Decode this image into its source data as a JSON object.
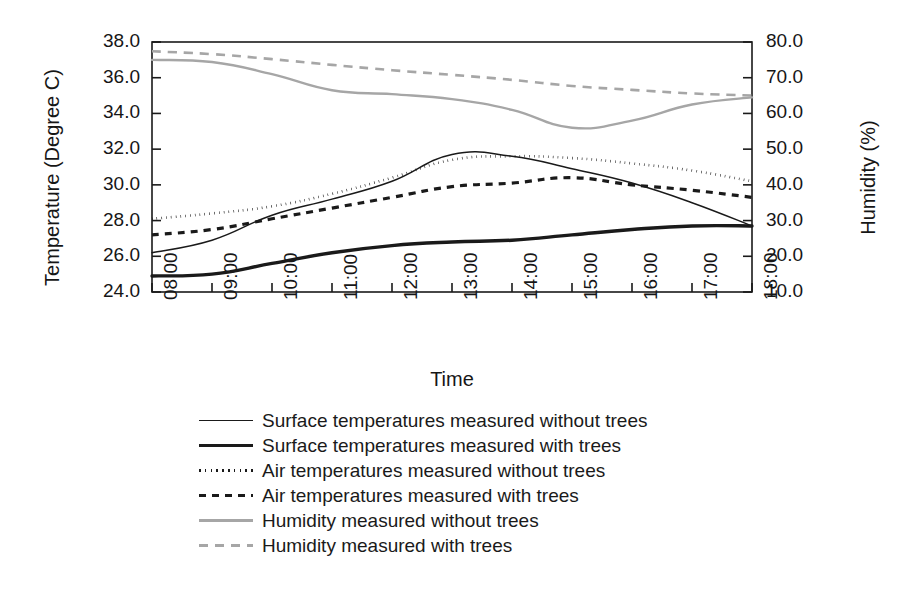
{
  "chart_data": {
    "type": "line",
    "title": "",
    "xlabel": "Time",
    "ylabel": "Temperature (Degree C)",
    "y2label": "Humidity (%)",
    "categories": [
      "08:00",
      "09:00",
      "10:00",
      "11:00",
      "12:00",
      "13:00",
      "14:00",
      "15:00",
      "16:00",
      "17:00",
      "18:00"
    ],
    "x_tick_labels": [
      "08:00",
      "09:00",
      "10:00",
      "11:00",
      "12:00",
      "13:00",
      "14:00",
      "15:00",
      "16:00",
      "17:00",
      "18:00"
    ],
    "y_tick_labels": [
      "38.0",
      "36.0",
      "34.0",
      "32.0",
      "30.0",
      "28.0",
      "26.0",
      "24.0"
    ],
    "y2_tick_labels": [
      "80.0",
      "70.0",
      "60.0",
      "50.0",
      "40.0",
      "30.0",
      "20.0",
      "10.0"
    ],
    "ylim": [
      24.0,
      38.0
    ],
    "y2lim": [
      10.0,
      80.0
    ],
    "grid": false,
    "legend_position": "below",
    "series": [
      {
        "name": "Surface temperatures measured without trees",
        "axis": "left",
        "style": "solid-thin",
        "color": "#1a1a1a",
        "values": [
          26.2,
          26.9,
          28.3,
          29.2,
          30.2,
          31.7,
          31.6,
          30.9,
          30.1,
          29.0,
          27.7
        ]
      },
      {
        "name": "Surface temperatures measured with trees",
        "axis": "left",
        "style": "solid-thick",
        "color": "#1a1a1a",
        "values": [
          24.9,
          25.0,
          25.6,
          26.2,
          26.6,
          26.8,
          26.9,
          27.2,
          27.5,
          27.7,
          27.7
        ]
      },
      {
        "name": "Air temperatures measured without trees",
        "axis": "left",
        "style": "dotted",
        "color": "#1a1a1a",
        "values": [
          28.1,
          28.4,
          28.8,
          29.5,
          30.4,
          31.4,
          31.6,
          31.5,
          31.2,
          30.8,
          30.2
        ]
      },
      {
        "name": "Air temperatures measured with trees",
        "axis": "left",
        "style": "dashed",
        "color": "#1a1a1a",
        "values": [
          27.2,
          27.5,
          28.1,
          28.7,
          29.3,
          29.9,
          30.1,
          30.4,
          30.0,
          29.7,
          29.3
        ]
      },
      {
        "name": "Humidity measured without trees",
        "axis": "right",
        "style": "solid-grey",
        "color": "#a6a6a6",
        "values": [
          75.0,
          74.4,
          71.0,
          66.5,
          65.4,
          64.0,
          61.0,
          56.0,
          58.0,
          62.5,
          64.5
        ]
      },
      {
        "name": "Humidity measured with trees",
        "axis": "right",
        "style": "dashed-grey",
        "color": "#a6a6a6",
        "values": [
          77.4,
          76.6,
          75.2,
          73.6,
          72.1,
          70.8,
          69.4,
          67.7,
          66.6,
          65.6,
          65.0
        ]
      }
    ]
  },
  "legend": {
    "entries": [
      {
        "label": "Surface temperatures measured without trees"
      },
      {
        "label": "Surface temperatures measured with trees"
      },
      {
        "label": "Air temperatures measured without trees"
      },
      {
        "label": "Air temperatures measured with trees"
      },
      {
        "label": "Humidity measured without trees"
      },
      {
        "label": "Humidity measured with trees"
      }
    ]
  }
}
